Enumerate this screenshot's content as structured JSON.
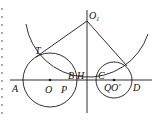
{
  "diagram": {
    "stroke_color": "#1a1a1a",
    "background": "#ffffff",
    "points": {
      "O1": {
        "label": "O",
        "sub": "1"
      },
      "T": {
        "label": "T"
      },
      "A": {
        "label": "A"
      },
      "O": {
        "label": "O"
      },
      "P": {
        "label": "P"
      },
      "B": {
        "label": "B"
      },
      "H": {
        "label": "H"
      },
      "C": {
        "label": "C"
      },
      "Q": {
        "label": "Q"
      },
      "O_prime": {
        "label": "O'"
      },
      "D": {
        "label": "D"
      }
    },
    "circles": [
      {
        "name": "circle-O",
        "cx": 50,
        "cy": 80,
        "r": 27
      },
      {
        "name": "circle-O-prime",
        "cx": 114,
        "cy": 80,
        "r": 18
      },
      {
        "name": "arc-O1",
        "cx": 87,
        "cy": 21,
        "r": 63
      }
    ]
  }
}
